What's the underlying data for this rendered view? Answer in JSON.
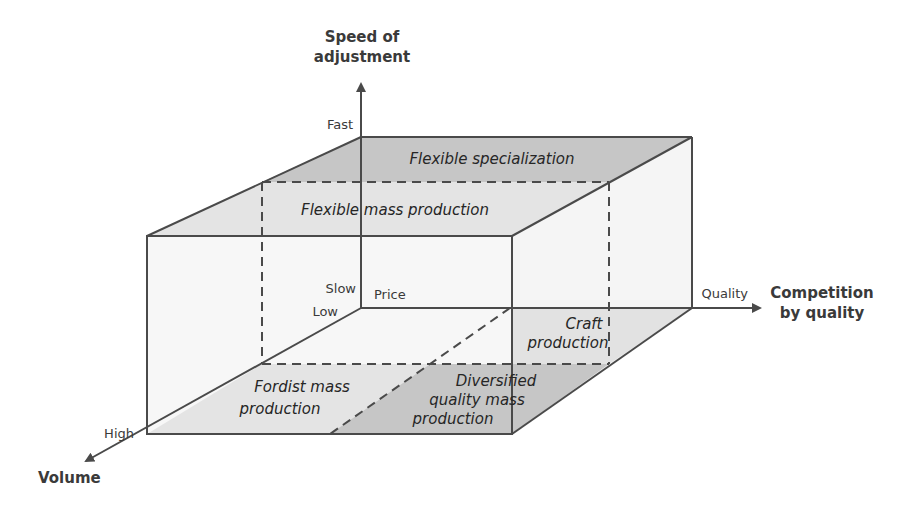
{
  "diagram": {
    "axes": {
      "vertical": {
        "title_line1": "Speed of",
        "title_line2": "adjustment",
        "high_label": "Fast",
        "low_label": "Slow"
      },
      "horizontal": {
        "title_line1": "Competition",
        "title_line2": "by quality",
        "low_label": "Price",
        "high_label": "Quality"
      },
      "depth": {
        "title": "Volume",
        "low_label": "Low",
        "high_label": "High"
      }
    },
    "regions": {
      "flexible_specialization": "Flexible specialization",
      "flexible_mass_production": "Flexible mass production",
      "craft_production_line1": "Craft",
      "craft_production_line2": "production",
      "fordist_line1": "Fordist mass",
      "fordist_line2": "production",
      "dqmp_line1": "Diversified",
      "dqmp_line2": "quality mass",
      "dqmp_line3": "production"
    },
    "colors": {
      "line": "#4a4a4a",
      "dark_fill": "#c4c4c4",
      "light_fill": "#e6e6e6",
      "face_fill": "#f7f7f7"
    }
  }
}
